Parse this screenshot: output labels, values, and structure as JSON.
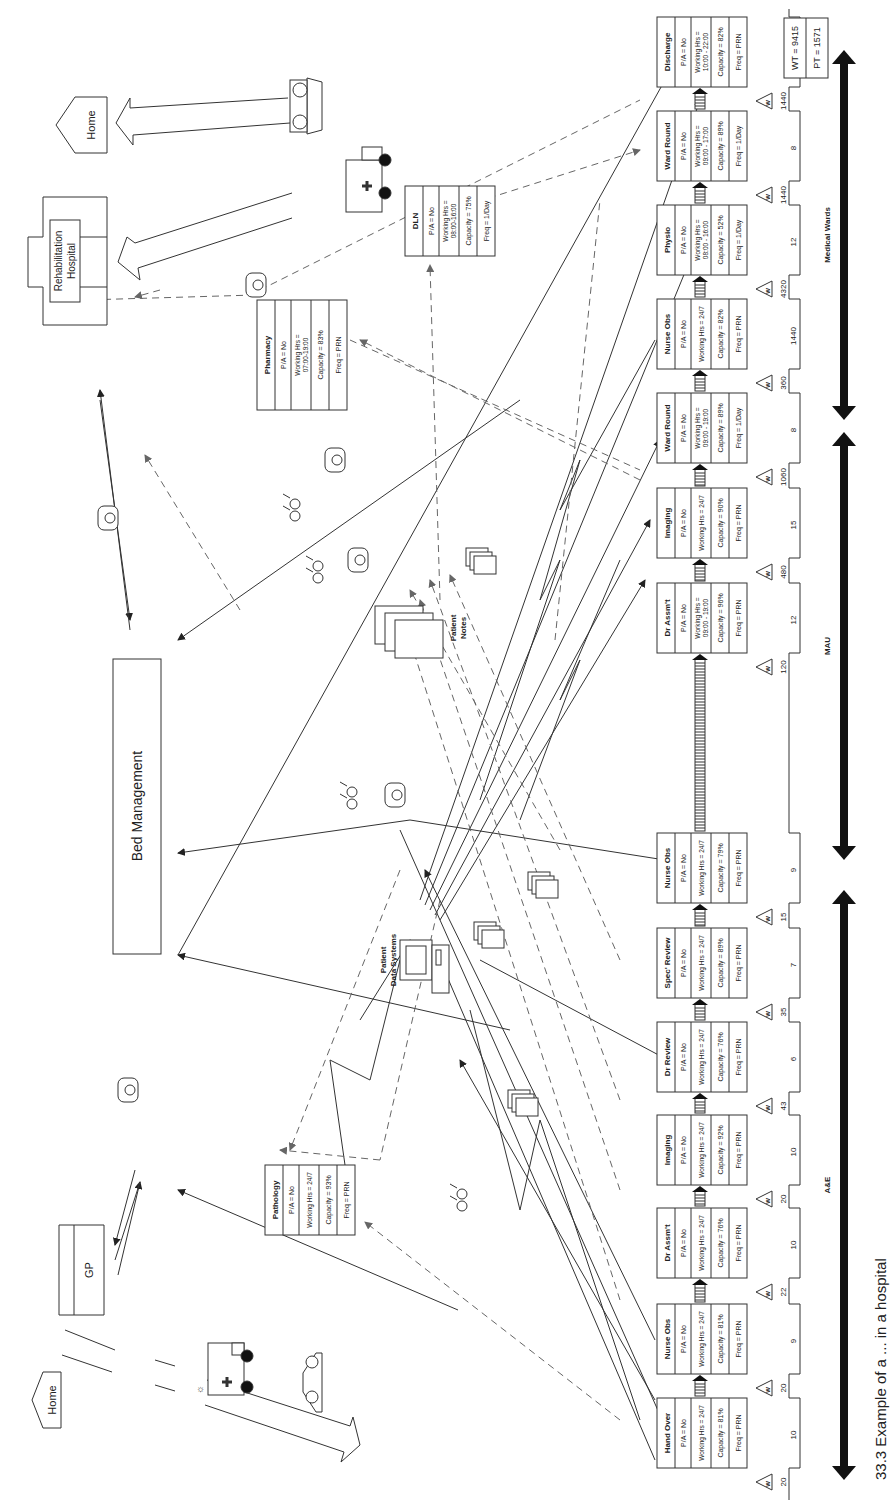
{
  "caption": "33.3 Example of a ... in a hospital",
  "external_entities": {
    "home_top": "Home",
    "rehab_hospital": [
      "Rehabilitation",
      "Hospital"
    ],
    "home_bottom": "Home",
    "gp": "GP",
    "bed_management": "Bed Management",
    "patient_notes": [
      "Patient",
      "Notes"
    ],
    "patient_data_systems": [
      "Patient",
      "Data Systems"
    ]
  },
  "support_processes": [
    {
      "title": "Pharmacy",
      "pa": "P/A = No",
      "hours": [
        "Working Hrs =",
        "07:00-19:00"
      ],
      "capacity": "Capacity = 83%",
      "freq": "Freq = PRN"
    },
    {
      "title": "DLN",
      "pa": "P/A = No",
      "hours": [
        "Working Hrs =",
        "08:00-16:00"
      ],
      "capacity": "Capacity = 75%",
      "freq": "Freq = 1/Day"
    },
    {
      "title": "Pathology",
      "pa": "P/A = No",
      "hours": [
        "Working Hrs = 24/7"
      ],
      "capacity": "Capacity = 93%",
      "freq": "Freq = PRN"
    }
  ],
  "processes": [
    {
      "title": "Hand Over",
      "pa": "P/A = No",
      "hours": [
        "Working Hrs = 24/7"
      ],
      "capacity": "Capacity = 81%",
      "freq": "Freq = PRN",
      "wait": "20",
      "process_time": "10"
    },
    {
      "title": "Nurse Obs",
      "pa": "P/A = No",
      "hours": [
        "Working Hrs = 24/7"
      ],
      "capacity": "Capacity = 81%",
      "freq": "Freq = PRN",
      "wait": "20",
      "process_time": "9"
    },
    {
      "title": "Dr Assm't",
      "pa": "P/A = No",
      "hours": [
        "Working Hrs = 24/7"
      ],
      "capacity": "Capacity = 76%",
      "freq": "Freq = PRN",
      "wait": "22",
      "process_time": "10"
    },
    {
      "title": "Imaging",
      "pa": "P/A = No",
      "hours": [
        "Working Hrs = 24/7"
      ],
      "capacity": "Capacity = 92%",
      "freq": "Freq = PRN",
      "wait": "20",
      "process_time": "10"
    },
    {
      "title": "Dr Review",
      "pa": "P/A = No",
      "hours": [
        "Working Hrs = 24/7"
      ],
      "capacity": "Capacity = 76%",
      "freq": "Freq = PRN",
      "wait": "43",
      "process_time": "6"
    },
    {
      "title": "Spec' Review",
      "pa": "P/A = No",
      "hours": [
        "Working Hrs = 24/7"
      ],
      "capacity": "Capacity = 89%",
      "freq": "Freq = PRN",
      "wait": "35",
      "process_time": "7"
    },
    {
      "title": "Nurse Obs",
      "pa": "P/A = No",
      "hours": [
        "Working Hrs = 24/7"
      ],
      "capacity": "Capacity = 79%",
      "freq": "Freq = PRN",
      "wait": "15",
      "process_time": "9"
    },
    {
      "title": "Dr Assm't",
      "pa": "P/A = No",
      "hours": [
        "Working Hrs =",
        "09:00 - 19:00"
      ],
      "capacity": "Capacity = 96%",
      "freq": "Freq = PRN",
      "wait": "120",
      "process_time": "12"
    },
    {
      "title": "Imaging",
      "pa": "P/A = No",
      "hours": [
        "Working Hrs = 24/7"
      ],
      "capacity": "Capacity = 90%",
      "freq": "Freq = PRN",
      "wait": "480",
      "process_time": "15"
    },
    {
      "title": "Ward Round",
      "pa": "P/A = No",
      "hours": [
        "Working Hrs =",
        "09:00 - 19:00"
      ],
      "capacity": "Capacity = 89%",
      "freq": "Freq = 1/Day",
      "wait": "1060",
      "process_time": "8"
    },
    {
      "title": "Nurse Obs",
      "pa": "P/A = No",
      "hours": [
        "Working Hrs = 24/7"
      ],
      "capacity": "Capacity = 82%",
      "freq": "Freq = PRN",
      "wait": "360",
      "process_time": "1440"
    },
    {
      "title": "Physio",
      "pa": "P/A = No",
      "hours": [
        "Working Hrs =",
        "08:00 - 16:00"
      ],
      "capacity": "Capacity = 52%",
      "freq": "Freq = 1/Day",
      "wait": "4320",
      "process_time": "12"
    },
    {
      "title": "Ward Round",
      "pa": "P/A = No",
      "hours": [
        "Working Hrs =",
        "09:00 - 17:00"
      ],
      "capacity": "Capacity = 89%",
      "freq": "Freq = 1/Day",
      "wait": "1440",
      "process_time": "8"
    },
    {
      "title": "Discharge",
      "pa": "P/A = No",
      "hours": [
        "Working Hrs =",
        "10:00 - 22:00"
      ],
      "capacity": "Capacity = 82%",
      "freq": "Freq = PRN",
      "wait": "1440",
      "process_time": "15"
    }
  ],
  "totals": {
    "wt": "WT = 9415",
    "pt": "PT = 1571"
  },
  "sections": [
    {
      "label": "A&E"
    },
    {
      "label": "MAU"
    },
    {
      "label": "Medical Wards"
    }
  ],
  "wait_icon_label": "W"
}
